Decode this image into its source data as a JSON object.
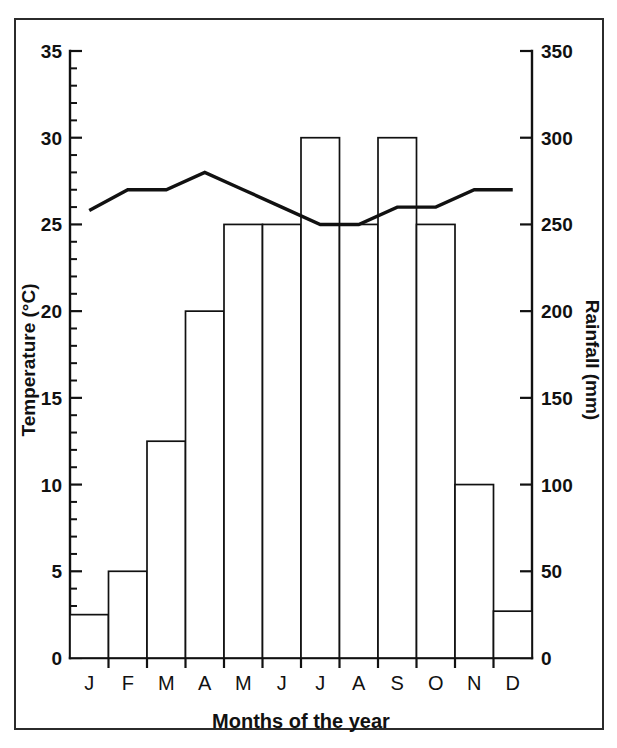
{
  "figure": {
    "frame_color": "#2b2b2b",
    "ink_color": "#111111",
    "background": "#ffffff"
  },
  "chart_data": {
    "type": "bar",
    "title": "",
    "subtitle": "",
    "xlabel": "Months of the year",
    "categories": [
      "J",
      "F",
      "M",
      "A",
      "M",
      "J",
      "J",
      "A",
      "S",
      "O",
      "N",
      "D"
    ],
    "month_names": [
      "January",
      "February",
      "March",
      "April",
      "May",
      "June",
      "July",
      "August",
      "September",
      "October",
      "November",
      "December"
    ],
    "grid": false,
    "legend": false,
    "legend_position": "none",
    "series": [
      {
        "name": "Rainfall",
        "type": "bar",
        "axis": "right",
        "unit": "mm",
        "ylabel": "Rainfall (mm)",
        "ylim": [
          0,
          350
        ],
        "ytick_step": 50,
        "yticks": [
          0,
          50,
          100,
          150,
          200,
          250,
          300,
          350
        ],
        "ytick_labels": [
          "0",
          "50",
          "100",
          "150",
          "200",
          "250",
          "300",
          "350"
        ],
        "values": [
          25,
          50,
          125,
          200,
          250,
          250,
          300,
          250,
          300,
          250,
          100,
          27
        ]
      },
      {
        "name": "Temperature",
        "type": "line",
        "axis": "left",
        "unit": "°C",
        "ylabel": "Temperature (°C)",
        "ylim": [
          0,
          35
        ],
        "ytick_step": 5,
        "yticks": [
          0,
          5,
          10,
          15,
          20,
          25,
          30,
          35
        ],
        "ytick_labels": [
          "0",
          "5",
          "10",
          "15",
          "20",
          "25",
          "30",
          "35"
        ],
        "minor_tick_step": 1,
        "values": [
          25.8,
          27.0,
          27.0,
          28.0,
          27.0,
          26.0,
          25.0,
          25.0,
          26.0,
          26.0,
          27.0,
          27.0
        ]
      }
    ]
  },
  "axes": {
    "left": {
      "title": "Temperature (°C)",
      "labels": [
        "35",
        "30",
        "25",
        "20",
        "15",
        "10",
        "5",
        "0"
      ]
    },
    "right": {
      "title": "Rainfall (mm)",
      "labels": [
        "350",
        "300",
        "250",
        "200",
        "150",
        "100",
        "50",
        "0"
      ]
    },
    "bottom": {
      "title": "Months of the year",
      "labels": [
        "J",
        "F",
        "M",
        "A",
        "M",
        "J",
        "J",
        "A",
        "S",
        "O",
        "N",
        "D"
      ]
    }
  }
}
